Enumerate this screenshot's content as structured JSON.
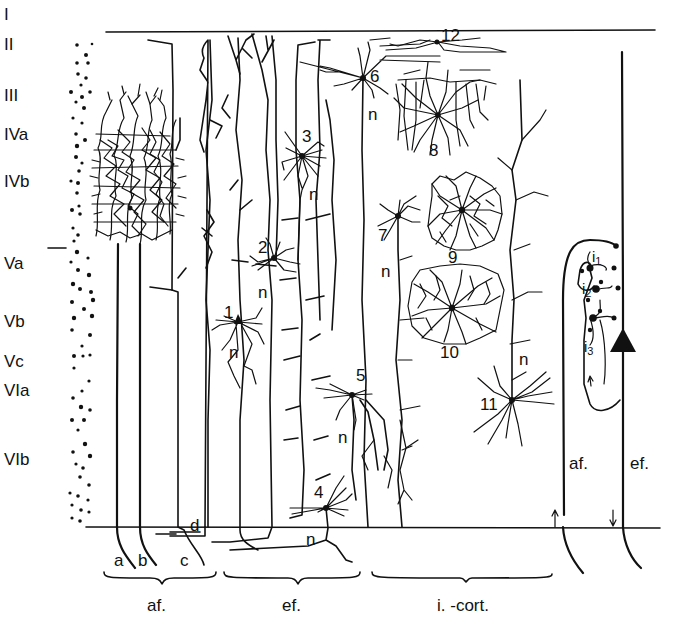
{
  "diagram": {
    "type": "cortical-neuron-circuit",
    "colors": {
      "ink": "#111111",
      "background": "#ffffff"
    },
    "layers": [
      {
        "label": "I",
        "y": 20
      },
      {
        "label": "II",
        "y": 50
      },
      {
        "label": "III",
        "y": 101
      },
      {
        "label": "IVa",
        "y": 140
      },
      {
        "label": "IVb",
        "y": 187
      },
      {
        "label": "Va",
        "y": 240
      },
      {
        "label": "Vb",
        "y": 292
      },
      {
        "label": "Vc",
        "y": 333
      },
      {
        "label": "VIa",
        "y": 362
      },
      {
        "label": "VIb",
        "y": 432
      }
    ],
    "afferent_fibers": [
      "a",
      "b",
      "c",
      "d"
    ],
    "neurons": [
      {
        "id": "1",
        "label": "1"
      },
      {
        "id": "2",
        "label": "2"
      },
      {
        "id": "3",
        "label": "3"
      },
      {
        "id": "4",
        "label": "4"
      },
      {
        "id": "5",
        "label": "5"
      },
      {
        "id": "6",
        "label": "6"
      },
      {
        "id": "7",
        "label": "7"
      },
      {
        "id": "8",
        "label": "8"
      },
      {
        "id": "9",
        "label": "9"
      },
      {
        "id": "10",
        "label": "10"
      },
      {
        "id": "11",
        "label": "11"
      },
      {
        "id": "12",
        "label": "12"
      }
    ],
    "neurite_label": "n",
    "groups": {
      "afferent": "af.",
      "efferent": "ef.",
      "intracortical": "i. -cort."
    },
    "schematic": {
      "afferent": "af.",
      "efferent": "ef.",
      "interneurons": [
        {
          "base": "i",
          "sub": "1"
        },
        {
          "base": "i",
          "sub": "2"
        },
        {
          "base": "i",
          "sub": "3"
        }
      ]
    }
  }
}
